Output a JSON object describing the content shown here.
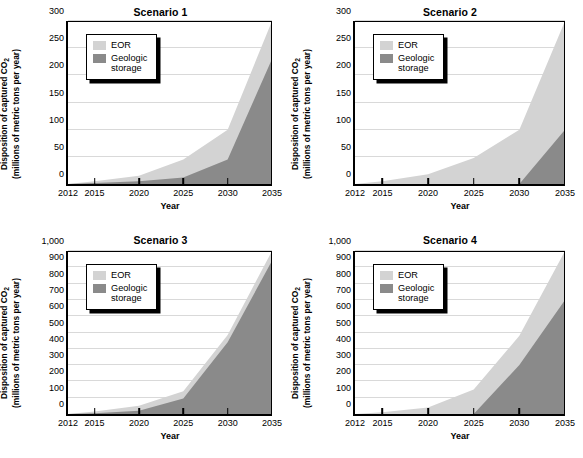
{
  "figure": {
    "background": "#ffffff",
    "colors": {
      "eor": "#d3d3d3",
      "geologic": "#8a8a8a",
      "axis": "#000000",
      "gridline": "#d9d9d9"
    },
    "legend": {
      "eor_label": "EOR",
      "geologic_label": "Geologic\nstorage"
    },
    "axis_titles": {
      "x": "Year",
      "y_line1": "Disposition of captured CO",
      "y_sub": "2",
      "y_line2": "(millions of metric tons per year)"
    }
  },
  "chart_data": [
    {
      "type": "area",
      "title": "Scenario 1",
      "xlabel": "Year",
      "ylabel": "Disposition of captured CO2 (millions of metric tons per year)",
      "x": [
        2012,
        2015,
        2020,
        2025,
        2030,
        2035
      ],
      "xlim": [
        2012,
        2035
      ],
      "ylim": [
        0,
        300
      ],
      "yticks": [
        0,
        50,
        100,
        150,
        200,
        250,
        300
      ],
      "ytick_labels": [
        "0",
        "50",
        "100",
        "150",
        "200",
        "250",
        "300"
      ],
      "xticks": [
        2012,
        2015,
        2020,
        2025,
        2030,
        2035
      ],
      "xtick_labels": [
        "2012",
        "2015",
        "2020",
        "2025",
        "2030",
        "2035"
      ],
      "grid": true,
      "legend_position": "upper left",
      "stacked": true,
      "series": [
        {
          "name": "Geologic storage",
          "color": "#8a8a8a",
          "values": [
            0,
            2,
            5,
            12,
            45,
            230
          ]
        },
        {
          "name": "EOR",
          "color": "#d3d3d3",
          "values": [
            0,
            3,
            10,
            33,
            55,
            70
          ]
        }
      ],
      "totals": [
        0,
        5,
        15,
        45,
        100,
        300
      ]
    },
    {
      "type": "area",
      "title": "Scenario 2",
      "xlabel": "Year",
      "ylabel": "Disposition of captured CO2 (millions of metric tons per year)",
      "x": [
        2012,
        2015,
        2020,
        2025,
        2030,
        2035
      ],
      "xlim": [
        2012,
        2035
      ],
      "ylim": [
        0,
        300
      ],
      "yticks": [
        0,
        50,
        100,
        150,
        200,
        250,
        300
      ],
      "ytick_labels": [
        "0",
        "50",
        "100",
        "150",
        "200",
        "250",
        "300"
      ],
      "xticks": [
        2012,
        2015,
        2020,
        2025,
        2030,
        2035
      ],
      "xtick_labels": [
        "2012",
        "2015",
        "2020",
        "2025",
        "2030",
        "2035"
      ],
      "grid": true,
      "legend_position": "upper left",
      "stacked": true,
      "series": [
        {
          "name": "Geologic storage",
          "color": "#8a8a8a",
          "values": [
            0,
            0,
            0,
            0,
            0,
            100
          ]
        },
        {
          "name": "EOR",
          "color": "#d3d3d3",
          "values": [
            0,
            5,
            18,
            48,
            100,
            200
          ]
        }
      ],
      "totals": [
        0,
        5,
        18,
        48,
        100,
        300
      ]
    },
    {
      "type": "area",
      "title": "Scenario 3",
      "xlabel": "Year",
      "ylabel": "Disposition of captured CO2 (millions of metric tons per year)",
      "x": [
        2012,
        2015,
        2020,
        2025,
        2030,
        2035
      ],
      "xlim": [
        2012,
        2035
      ],
      "ylim": [
        0,
        1000
      ],
      "yticks": [
        0,
        100,
        200,
        300,
        400,
        500,
        600,
        700,
        800,
        900,
        1000
      ],
      "ytick_labels": [
        "0",
        "100",
        "200",
        "300",
        "400",
        "500",
        "600",
        "700",
        "800",
        "900",
        "1,000"
      ],
      "xticks": [
        2012,
        2015,
        2020,
        2025,
        2030,
        2035
      ],
      "xtick_labels": [
        "2012",
        "2015",
        "2020",
        "2025",
        "2030",
        "2035"
      ],
      "grid": true,
      "legend_position": "upper left",
      "stacked": true,
      "series": [
        {
          "name": "Geologic storage",
          "color": "#8a8a8a",
          "values": [
            0,
            5,
            20,
            95,
            440,
            940
          ]
        },
        {
          "name": "EOR",
          "color": "#d3d3d3",
          "values": [
            0,
            10,
            30,
            45,
            45,
            60
          ]
        }
      ],
      "totals": [
        0,
        15,
        50,
        140,
        485,
        1000
      ]
    },
    {
      "type": "area",
      "title": "Scenario 4",
      "xlabel": "Year",
      "ylabel": "Disposition of captured CO2 (millions of metric tons per year)",
      "x": [
        2012,
        2015,
        2020,
        2025,
        2030,
        2035
      ],
      "xlim": [
        2012,
        2035
      ],
      "ylim": [
        0,
        1000
      ],
      "yticks": [
        0,
        100,
        200,
        300,
        400,
        500,
        600,
        700,
        800,
        900,
        1000
      ],
      "ytick_labels": [
        "0",
        "100",
        "200",
        "300",
        "400",
        "500",
        "600",
        "700",
        "800",
        "900",
        "1,000"
      ],
      "xticks": [
        2012,
        2015,
        2020,
        2025,
        2030,
        2035
      ],
      "xtick_labels": [
        "2012",
        "2015",
        "2020",
        "2025",
        "2030",
        "2035"
      ],
      "grid": true,
      "legend_position": "upper left",
      "stacked": true,
      "series": [
        {
          "name": "Geologic storage",
          "color": "#8a8a8a",
          "values": [
            0,
            0,
            0,
            0,
            300,
            700
          ]
        },
        {
          "name": "EOR",
          "color": "#d3d3d3",
          "values": [
            0,
            10,
            40,
            150,
            180,
            300
          ]
        }
      ],
      "totals": [
        0,
        10,
        40,
        150,
        480,
        1000
      ]
    }
  ]
}
